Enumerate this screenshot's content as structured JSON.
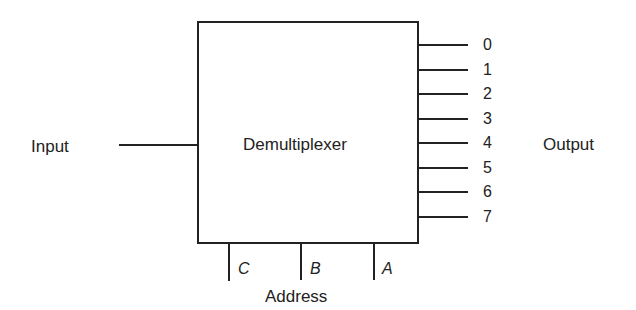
{
  "diagram": {
    "block_label": "Demultiplexer",
    "input_label": "Input",
    "output_label": "Output",
    "address_label": "Address",
    "outputs": [
      "0",
      "1",
      "2",
      "3",
      "4",
      "5",
      "6",
      "7"
    ],
    "address_lines": [
      "C",
      "B",
      "A"
    ]
  }
}
